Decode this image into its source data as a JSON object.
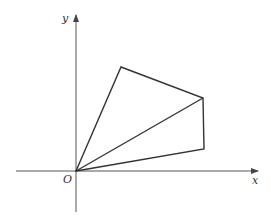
{
  "labels": {
    "y": "y",
    "x": "x",
    "origin": "O"
  },
  "axes": {
    "x_axis": {
      "x1": 16,
      "y1": 171,
      "x2": 258,
      "y2": 171
    },
    "y_axis": {
      "x1": 76,
      "y1": 212,
      "x2": 76,
      "y2": 15
    }
  },
  "points": {
    "O": [
      76,
      171
    ],
    "A": [
      121,
      67
    ],
    "B": [
      203,
      98
    ],
    "C": [
      204,
      149
    ]
  },
  "colors": {
    "stroke": "#333333",
    "axis": "#555555"
  }
}
